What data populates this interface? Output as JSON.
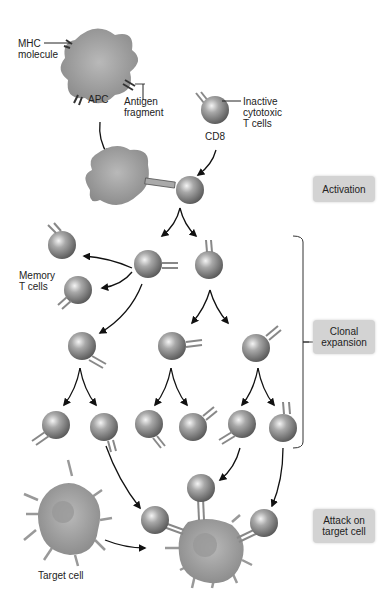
{
  "labels": {
    "mhc": [
      "MHC",
      "molecule"
    ],
    "apc": "APC",
    "antigen": [
      "Antigen",
      "fragment"
    ],
    "inactive": [
      "Inactive",
      "cytotoxic",
      "T cells"
    ],
    "cd8": "CD8",
    "memory": [
      "Memory",
      "T cells"
    ],
    "target": "Target cell"
  },
  "stages": {
    "activation": "Activation",
    "clonal": [
      "Clonal",
      "expansion"
    ],
    "attack": [
      "Attack on",
      "target cell"
    ]
  },
  "colors": {
    "stage_bg": "#d3d3d3",
    "cell_gray": "#8a8a8a",
    "apc_gray": "#9a9a9a",
    "arrow": "#111111"
  }
}
